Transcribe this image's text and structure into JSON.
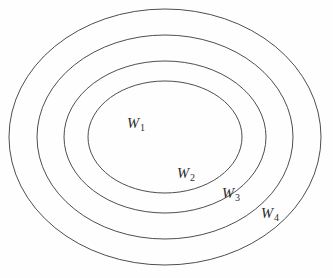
{
  "figure": {
    "background_color": "#fefefe",
    "stroke_color": "#3a3a3a",
    "label_color": "#2b2b2b",
    "width": 333,
    "height": 278
  },
  "chart_data": {
    "type": "diagram",
    "subtype": "nested-concentric-ellipses",
    "title": "",
    "xlabel": "",
    "ylabel": "",
    "grid": false,
    "legend": null,
    "center": {
      "x": 165,
      "y": 137
    },
    "regions": [
      {
        "id": "w1",
        "label_base": "W",
        "label_sub": "1",
        "order": 1,
        "rx": 77,
        "ry": 56,
        "label_x": 136,
        "label_y": 124
      },
      {
        "id": "w2",
        "label_base": "W",
        "label_sub": "2",
        "order": 2,
        "rx": 101,
        "ry": 76,
        "label_x": 186,
        "label_y": 174
      },
      {
        "id": "w3",
        "label_base": "W",
        "label_sub": "3",
        "order": 3,
        "rx": 128,
        "ry": 102,
        "label_x": 231,
        "label_y": 194
      },
      {
        "id": "w4",
        "label_base": "W",
        "label_sub": "4",
        "order": 4,
        "rx": 156,
        "ry": 128,
        "label_x": 270,
        "label_y": 214
      }
    ]
  }
}
